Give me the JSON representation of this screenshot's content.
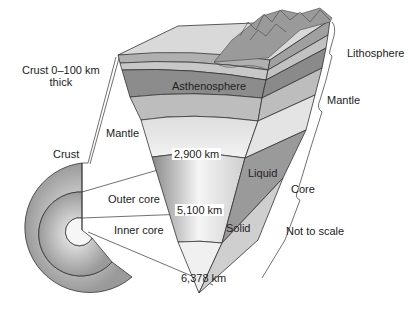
{
  "diagram": {
    "title": "",
    "labels": {
      "crust_thickness_line1": "Crust 0–100 km",
      "crust_thickness_line2": "thick",
      "lithosphere": "Lithosphere",
      "asthenosphere": "Asthenosphere",
      "mantle_right": "Mantle",
      "mantle_left": "Mantle",
      "crust": "Crust",
      "depth_2900": "2,900 km",
      "liquid": "Liquid",
      "core": "Core",
      "outer_core": "Outer core",
      "depth_5100": "5,100 km",
      "inner_core": "Inner core",
      "solid": "Solid",
      "not_to_scale": "Not to scale",
      "depth_6378": "6,378 km"
    },
    "colors": {
      "line": "#333333",
      "crust_top": "#d9d9d9",
      "lithosphere_band": "#a8a8a8",
      "asthenosphere_band": "#8c8c8c",
      "mantle_light": "#dcdcdc",
      "outer_core_dark": "#8a8a8a",
      "inner_core_light": "#c8c8c8",
      "mountains": "#9a9a9a"
    }
  }
}
